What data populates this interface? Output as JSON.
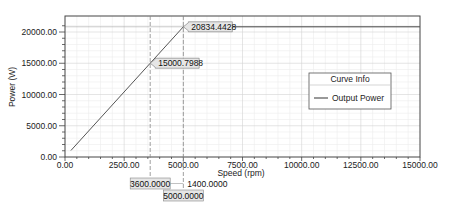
{
  "chart_data": {
    "type": "line",
    "title": "",
    "xlabel": "Speed (rpm)",
    "ylabel": "Power (W)",
    "xlim": [
      0,
      15000
    ],
    "ylim": [
      0,
      21500
    ],
    "grid": true,
    "legend_position": "right-center",
    "x_ticks": [
      "0.00",
      "2500.00",
      "5000.00",
      "7500.00",
      "10000.00",
      "12500.00",
      "15000.00"
    ],
    "y_ticks": [
      "0.00",
      "5000.00",
      "10000.00",
      "15000.00",
      "20000.00"
    ],
    "legend": {
      "title": "Curve Info",
      "entries": [
        "Output Power"
      ]
    },
    "series": [
      {
        "name": "Output Power",
        "x": [
          250,
          3600,
          5000,
          15000
        ],
        "y": [
          1042,
          15000.7988,
          20834.4428,
          20834.4428
        ]
      }
    ],
    "markers": {
      "x_markers": [
        {
          "value": 3600,
          "label": "3600.0000"
        },
        {
          "value": 5000,
          "label": "5000.0000"
        }
      ],
      "delta_label": "1400.0000",
      "y_markers": [
        {
          "x": 3600,
          "value": 15000.7988,
          "label": "15000.7988"
        },
        {
          "x": 5000,
          "value": 20834.4428,
          "label": "20834.4428"
        }
      ]
    }
  }
}
